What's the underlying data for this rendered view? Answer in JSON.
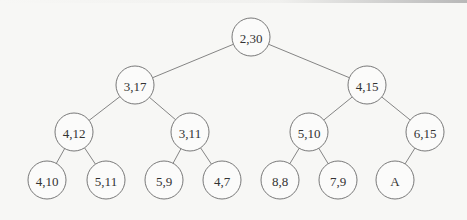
{
  "diagram": {
    "type": "binary-tree",
    "nodes": [
      {
        "id": "n0",
        "label": "2,30",
        "x": 251,
        "y": 37
      },
      {
        "id": "n1",
        "label": "3,17",
        "x": 135,
        "y": 85
      },
      {
        "id": "n2",
        "label": "4,15",
        "x": 367,
        "y": 85
      },
      {
        "id": "n3",
        "label": "4,12",
        "x": 74,
        "y": 132
      },
      {
        "id": "n4",
        "label": "3,11",
        "x": 190,
        "y": 132
      },
      {
        "id": "n5",
        "label": "5,10",
        "x": 309,
        "y": 132
      },
      {
        "id": "n6",
        "label": "6,15",
        "x": 425,
        "y": 132
      },
      {
        "id": "n7",
        "label": "4,10",
        "x": 47,
        "y": 180
      },
      {
        "id": "n8",
        "label": "5,11",
        "x": 106,
        "y": 180
      },
      {
        "id": "n9",
        "label": "5,9",
        "x": 164,
        "y": 180
      },
      {
        "id": "n10",
        "label": "4,7",
        "x": 222,
        "y": 180
      },
      {
        "id": "n11",
        "label": "8,8",
        "x": 280,
        "y": 180
      },
      {
        "id": "n12",
        "label": "7,9",
        "x": 338,
        "y": 180
      },
      {
        "id": "n13",
        "label": "A",
        "x": 395,
        "y": 180
      }
    ],
    "edges": [
      [
        "n0",
        "n1"
      ],
      [
        "n0",
        "n2"
      ],
      [
        "n1",
        "n3"
      ],
      [
        "n1",
        "n4"
      ],
      [
        "n2",
        "n5"
      ],
      [
        "n2",
        "n6"
      ],
      [
        "n3",
        "n7"
      ],
      [
        "n3",
        "n8"
      ],
      [
        "n4",
        "n9"
      ],
      [
        "n4",
        "n10"
      ],
      [
        "n5",
        "n11"
      ],
      [
        "n5",
        "n12"
      ],
      [
        "n6",
        "n13"
      ]
    ],
    "node_radius": 19
  }
}
